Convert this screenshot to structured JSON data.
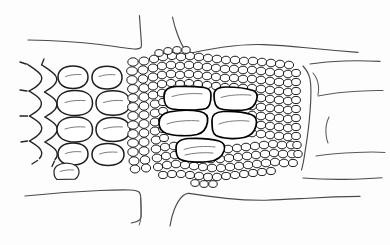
{
  "figure": {
    "title": "Plant tissue cross-section line drawing",
    "background_color": "#fdfdfd",
    "ink_color": "#1d1d1d",
    "contour_color": "#4a4a4a",
    "width": 390,
    "height": 245
  },
  "regions": [
    {
      "id": "upper-epidermis",
      "label": "upper epidermis contour",
      "notch": "v-notch"
    },
    {
      "id": "left-parenchyma",
      "label": "left large parenchyma cells",
      "cell_count": 14
    },
    {
      "id": "dense-sclerenchyma",
      "label": "dense small-celled sclerenchyma region",
      "cell_count": 520
    },
    {
      "id": "vascular-bundle",
      "label": "central vascular bundle",
      "vessel_count": 5
    },
    {
      "id": "right-large-cells",
      "label": "right large thin-walled cells",
      "cell_count": 3
    },
    {
      "id": "lower-epidermis",
      "label": "lower epidermis contour",
      "notch": "v-notch"
    }
  ],
  "vessels": [
    {
      "id": "vessel-1",
      "position": "upper-left"
    },
    {
      "id": "vessel-2",
      "position": "upper-right"
    },
    {
      "id": "vessel-3",
      "position": "middle-left"
    },
    {
      "id": "vessel-4",
      "position": "middle-right"
    },
    {
      "id": "vessel-5",
      "position": "lower-center"
    }
  ]
}
